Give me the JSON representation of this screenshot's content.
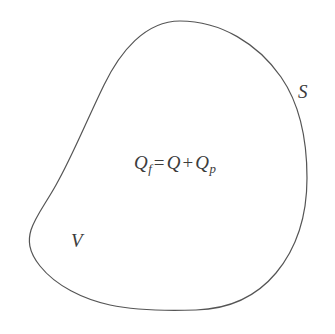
{
  "figure": {
    "background_color": "#ffffff",
    "stroke_color": "#555555",
    "text_color": "#3c3c3c",
    "stroke_width": 1.2,
    "boundary_label": "S",
    "region_label": "V",
    "equation": {
      "full_text": "Qf = Q + Qp",
      "lhs_symbol": "Q",
      "lhs_subscript": "f",
      "equals_sign": "=",
      "rhs_first_symbol": "Q",
      "plus_sign": "+",
      "rhs_second_symbol": "Q",
      "rhs_second_subscript": "p"
    }
  }
}
